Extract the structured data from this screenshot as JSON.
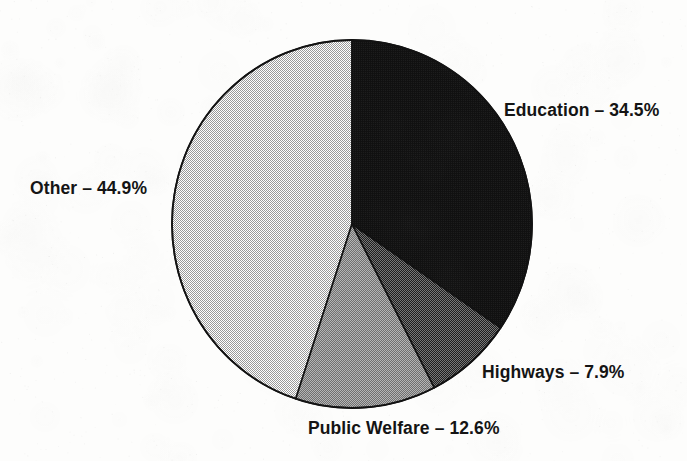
{
  "chart_data": {
    "type": "pie",
    "title": "",
    "subtitle": "",
    "xlabel": "",
    "ylabel": "",
    "legend_position": "none",
    "grid": false,
    "label_separator": "–",
    "start_angle_deg": 0,
    "direction": "clockwise",
    "categories": [
      "Education",
      "Highways",
      "Public Welfare",
      "Other"
    ],
    "values": [
      34.5,
      7.9,
      12.6,
      44.9
    ],
    "units": "percent",
    "total": 99.9,
    "slices": [
      {
        "name": "Education",
        "value": 34.5,
        "value_text": "34.5%",
        "label": "Education – 34.5%",
        "fill_style": "solid",
        "color": "#151515",
        "start_deg": 0.0,
        "end_deg": 124.2
      },
      {
        "name": "Highways",
        "value": 7.9,
        "value_text": "7.9%",
        "label": "Highways – 7.9%",
        "fill_style": "dither-dark",
        "color": "#4a4a4a",
        "start_deg": 124.2,
        "end_deg": 152.6
      },
      {
        "name": "Public Welfare",
        "value": 12.6,
        "value_text": "12.6%",
        "label": "Public Welfare – 12.6%",
        "fill_style": "dither-medium",
        "color": "#8f8f8f",
        "start_deg": 152.6,
        "end_deg": 198.0
      },
      {
        "name": "Other",
        "value": 44.9,
        "value_text": "44.9%",
        "label": "Other – 44.9%",
        "fill_style": "dither-light",
        "color": "#d9d9d9",
        "start_deg": 198.0,
        "end_deg": 360.0
      }
    ]
  },
  "labels": {
    "education": "Education – 34.5%",
    "other": "Other – 44.9%",
    "highways": "Highways – 7.9%",
    "public_welfare": "Public Welfare – 12.6%"
  },
  "colors": {
    "background": "#fdfdfc",
    "outline": "#121212",
    "text": "#141414",
    "education": "#151515",
    "highways": "#4a4a4a",
    "public_welfare": "#8f8f8f",
    "other": "#d9d9d9"
  },
  "geometry": {
    "center_x": 352,
    "center_y": 224,
    "radius_x": 180,
    "radius_y": 184
  }
}
